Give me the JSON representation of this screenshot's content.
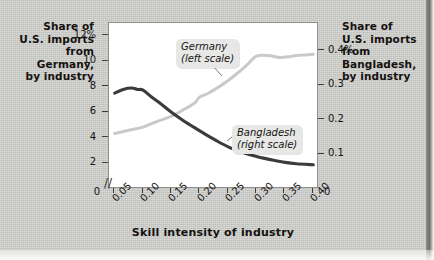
{
  "figure": {
    "background_color": "#cbcbc8",
    "plot_background": "#ffffff"
  },
  "left_axis_title": "Share of\nU.S. imports\nfrom\nGermany,\nby industry",
  "right_axis_title": "Share of\nU.S. imports\nfrom\nBangladesh,\nby industry",
  "callouts": {
    "germany_line1": "Germany",
    "germany_line2": "(left scale)",
    "bangladesh_line1": "Bangladesh",
    "bangladesh_line2": "(right scale)"
  },
  "axis_break_symbol": "//",
  "origin_left_label": "0",
  "origin_right_label": "0",
  "chart_data": {
    "type": "line",
    "title": "",
    "subtitle": "",
    "xlabel": "Skill intensity of industry",
    "ylabel": "Share of U.S. imports from Germany, by industry",
    "y2label": "Share of U.S. imports from Bangladesh, by industry",
    "grid": false,
    "legend_position": "inline-callouts",
    "xlim": [
      0.04,
      0.41
    ],
    "xticks": [
      0.05,
      0.1,
      0.15,
      0.2,
      0.25,
      0.3,
      0.35,
      0.4
    ],
    "xtick_labels": [
      "0.05",
      "0.10",
      "0.15",
      "0.20",
      "0.25",
      "0.30",
      "0.35",
      "0.40"
    ],
    "ylim": [
      0,
      13
    ],
    "yticks": [
      2,
      4,
      6,
      8,
      10,
      12
    ],
    "ytick_labels": [
      "2",
      "4",
      "6",
      "8",
      "10",
      "12%"
    ],
    "y2lim": [
      0,
      0.48
    ],
    "y2ticks": [
      0.1,
      0.2,
      0.3,
      0.4
    ],
    "y2tick_labels": [
      "0.1",
      "0.2",
      "0.3",
      "0.4%"
    ],
    "series": [
      {
        "name": "Germany (left scale)",
        "axis": "left",
        "color": "#c9c9c9",
        "x": [
          0.05,
          0.075,
          0.1,
          0.125,
          0.15,
          0.175,
          0.19,
          0.2,
          0.215,
          0.23,
          0.25,
          0.27,
          0.285,
          0.3,
          0.32,
          0.34,
          0.355,
          0.37,
          0.385,
          0.4
        ],
        "values": [
          4.35,
          4.6,
          4.85,
          5.3,
          5.7,
          6.3,
          6.7,
          7.2,
          7.5,
          7.9,
          8.5,
          9.2,
          9.8,
          10.4,
          10.45,
          10.3,
          10.35,
          10.45,
          10.5,
          10.55
        ]
      },
      {
        "name": "Bangladesh (right scale)",
        "axis": "right",
        "color": "#3b3b3b",
        "x": [
          0.05,
          0.065,
          0.08,
          0.09,
          0.1,
          0.115,
          0.13,
          0.15,
          0.17,
          0.19,
          0.21,
          0.23,
          0.25,
          0.27,
          0.29,
          0.31,
          0.33,
          0.35,
          0.37,
          0.4
        ],
        "values": [
          0.277,
          0.288,
          0.292,
          0.288,
          0.286,
          0.266,
          0.248,
          0.222,
          0.199,
          0.178,
          0.158,
          0.139,
          0.122,
          0.109,
          0.098,
          0.09,
          0.083,
          0.077,
          0.073,
          0.07
        ]
      }
    ]
  }
}
